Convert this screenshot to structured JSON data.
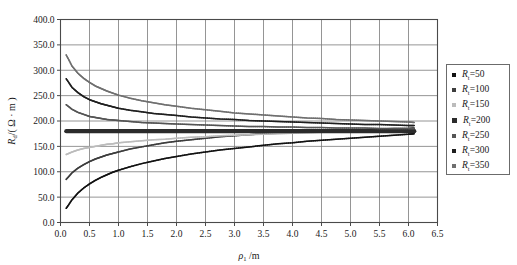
{
  "chart_data": {
    "type": "line",
    "title": "",
    "subtitle": "",
    "xlabel": "ρ₁ /m",
    "xlabel_symbol": "ρ",
    "xlabel_sub": "1",
    "xlabel_unit": "/m",
    "ylabel": "Rd /( Ω · m )",
    "ylabel_symbol": "R",
    "ylabel_sub": "d",
    "ylabel_unit": "/( Ω · m )",
    "xlim": [
      0.0,
      6.5
    ],
    "ylim": [
      0.0,
      400.0
    ],
    "xticks": [
      "0.0",
      "0.5",
      "1.0",
      "1.5",
      "2.0",
      "2.5",
      "3.0",
      "3.5",
      "4.0",
      "4.5",
      "5.0",
      "5.5",
      "6.0",
      "6.5"
    ],
    "xtick_values": [
      0.0,
      0.5,
      1.0,
      1.5,
      2.0,
      2.5,
      3.0,
      3.5,
      4.0,
      4.5,
      5.0,
      5.5,
      6.0,
      6.5
    ],
    "yticks": [
      "0.0",
      "50.0",
      "100.0",
      "150.0",
      "200.0",
      "250.0",
      "300.0",
      "350.0",
      "400.0"
    ],
    "ytick_values": [
      0,
      50,
      100,
      150,
      200,
      250,
      300,
      350,
      400
    ],
    "grid": true,
    "grid_color": "#7a7a7a",
    "legend_position": "right-outside",
    "x": [
      0.1,
      0.2,
      0.3,
      0.4,
      0.5,
      0.6,
      0.7,
      0.8,
      0.9,
      1.0,
      1.2,
      1.4,
      1.6,
      1.8,
      2.0,
      2.25,
      2.5,
      2.75,
      3.0,
      3.25,
      3.5,
      3.75,
      4.0,
      4.25,
      4.5,
      4.75,
      5.0,
      5.25,
      5.5,
      5.75,
      6.0,
      6.1
    ],
    "series": [
      {
        "name": "Rt=50",
        "legend_label": "Rₜ=50",
        "value": 50,
        "color": "#121212",
        "values": [
          28,
          45,
          58,
          68,
          76,
          83,
          89,
          94,
          99,
          103,
          110,
          116,
          121,
          126,
          130,
          135,
          139,
          143,
          146,
          149,
          152,
          155,
          157,
          160,
          162,
          164,
          166,
          168,
          170,
          172,
          174,
          175
        ]
      },
      {
        "name": "Rt=100",
        "legend_label": "Rₜ=100",
        "value": 100,
        "color": "#3d3d3d",
        "values": [
          85,
          98,
          107,
          114,
          120,
          125,
          129,
          133,
          136,
          139,
          145,
          149,
          153,
          157,
          160,
          163,
          166,
          169,
          171,
          173,
          175,
          176,
          178,
          179,
          180,
          181,
          182,
          183,
          184,
          185,
          185,
          186
        ]
      },
      {
        "name": "Rt=150",
        "legend_label": "Rₜ=150",
        "value": 150,
        "color": "#bcbcbc",
        "values": [
          134,
          139,
          143,
          146,
          148,
          150,
          152,
          154,
          155,
          157,
          159,
          161,
          163,
          164,
          166,
          168,
          169,
          171,
          172,
          173,
          174,
          175,
          176,
          177,
          178,
          178,
          179,
          180,
          180,
          181,
          181,
          182
        ]
      },
      {
        "name": "Rt=200",
        "legend_label": "Rₜ=200",
        "value": 200,
        "color": "#2b2b2b",
        "thick": true,
        "values": [
          180,
          180,
          180,
          180,
          180,
          180,
          180,
          180,
          180,
          180,
          180,
          180,
          180,
          180,
          180,
          180,
          180,
          180,
          180,
          180,
          180,
          180,
          180,
          180,
          180,
          180,
          180,
          180,
          180,
          180,
          180,
          180
        ]
      },
      {
        "name": "Rt=250",
        "legend_label": "Rₜ=250",
        "value": 250,
        "color": "#555555",
        "values": [
          232,
          223,
          217,
          213,
          209,
          207,
          205,
          203,
          202,
          201,
          199,
          197,
          196,
          195,
          194,
          193,
          192,
          191,
          190,
          189,
          189,
          188,
          188,
          187,
          187,
          186,
          186,
          186,
          185,
          185,
          185,
          185
        ]
      },
      {
        "name": "Rt=300",
        "legend_label": "Rₜ=300",
        "value": 300,
        "color": "#1f1f1f",
        "values": [
          283,
          266,
          256,
          248,
          242,
          238,
          234,
          231,
          228,
          225,
          221,
          218,
          215,
          213,
          211,
          208,
          206,
          204,
          203,
          201,
          200,
          199,
          198,
          197,
          196,
          195,
          194,
          193,
          193,
          192,
          191,
          191
        ]
      },
      {
        "name": "Rt=350",
        "legend_label": "Rₜ=350",
        "value": 350,
        "color": "#6f6f6f",
        "values": [
          330,
          308,
          294,
          284,
          276,
          269,
          264,
          259,
          255,
          251,
          245,
          240,
          236,
          232,
          229,
          225,
          222,
          219,
          216,
          214,
          212,
          210,
          208,
          206,
          205,
          203,
          202,
          201,
          200,
          199,
          198,
          197
        ]
      }
    ]
  },
  "legend": {
    "items": [
      {
        "label": "Rₜ=50",
        "marker_color": "#121212"
      },
      {
        "label": "Rₜ=100",
        "marker_color": "#3d3d3d"
      },
      {
        "label": "Rₜ=150",
        "marker_color": "#bcbcbc"
      },
      {
        "label": "Rₜ=200",
        "marker_color": "#2b2b2b"
      },
      {
        "label": "Rₜ=250",
        "marker_color": "#555555"
      },
      {
        "label": "Rₜ=300",
        "marker_color": "#1f1f1f"
      },
      {
        "label": "Rₜ=350",
        "marker_color": "#6f6f6f"
      }
    ]
  }
}
